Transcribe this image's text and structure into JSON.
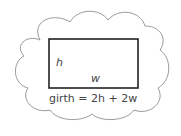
{
  "diagram": {
    "labels": {
      "height": "h",
      "width": "w"
    },
    "formula": "girth = 2h + 2w",
    "colors": {
      "outline": "#999999",
      "rectangle": "#222222",
      "text": "#444444"
    }
  }
}
